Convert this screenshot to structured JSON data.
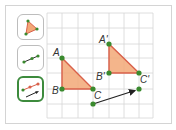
{
  "colors": {
    "point": "#3a8a2e",
    "triangle_fill": "#f2a877",
    "triangle_stroke": "#d9604a",
    "vector": "#222222",
    "grid": "#cfcfcf",
    "tool_border": "#bdbdbd",
    "tool_selected_border": "#3d8b3d"
  },
  "toolbar": {
    "tools": [
      {
        "name": "polygon-tool",
        "icon": "triangle-polygon-icon",
        "selected": false
      },
      {
        "name": "vector-tool",
        "icon": "vector-points-icon",
        "selected": false
      },
      {
        "name": "translate-by-vector-tool",
        "icon": "translate-by-vector-icon",
        "selected": true
      }
    ]
  },
  "figure": {
    "triangle_original": {
      "points": [
        {
          "label": "A",
          "x": 62,
          "y": 58
        },
        {
          "label": "B",
          "x": 62,
          "y": 89
        },
        {
          "label": "C",
          "x": 93,
          "y": 89
        }
      ]
    },
    "triangle_image": {
      "points": [
        {
          "label": "A'",
          "x": 109,
          "y": 44
        },
        {
          "label": "B'",
          "x": 109,
          "y": 73
        },
        {
          "label": "C'",
          "x": 139,
          "y": 73
        }
      ]
    },
    "vector": {
      "from": {
        "x": 93,
        "y": 104
      },
      "to": {
        "x": 139,
        "y": 89
      }
    },
    "labels": {
      "A": "A",
      "B": "B",
      "C": "C",
      "A_prime": "A'",
      "B_prime": "B'",
      "C_prime": "C'"
    }
  }
}
